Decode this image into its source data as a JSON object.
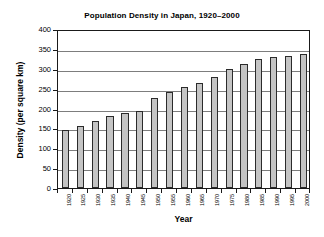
{
  "chart_data": {
    "type": "bar",
    "title": "Population Density in Japan, 1920–2000",
    "xlabel": "Year",
    "ylabel": "Density (per square km)",
    "categories": [
      "1920",
      "1925",
      "1930",
      "1935",
      "1940",
      "1945",
      "1950",
      "1955",
      "1960",
      "1965",
      "1970",
      "1975",
      "1980",
      "1985",
      "1990",
      "1995",
      "2000"
    ],
    "values": [
      145,
      157,
      169,
      180,
      189,
      195,
      227,
      241,
      253,
      265,
      279,
      299,
      313,
      324,
      329,
      332,
      336
    ],
    "ylim": [
      0,
      400
    ],
    "yticks": [
      0,
      50,
      100,
      150,
      200,
      250,
      300,
      350,
      400
    ],
    "ytick_labels": [
      "0",
      "50",
      "100",
      "150",
      "200",
      "250",
      "300",
      "350",
      "400"
    ],
    "grid": true,
    "grid_axis": "y",
    "legend": false,
    "bar_fill_color": "#c4c4c4",
    "bar_edge_color": "#2b2b2b",
    "axis_color": "#1a1a1a",
    "grid_color": "#7d7d7d",
    "background_color": "#ffffff"
  }
}
